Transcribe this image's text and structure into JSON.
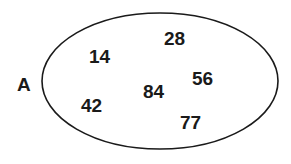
{
  "diagram": {
    "type": "set",
    "set_label": "A",
    "elements": [
      "28",
      "14",
      "56",
      "84",
      "42",
      "77"
    ],
    "stroke_color": "#1a1a1a",
    "text_color": "#1a1a1a"
  }
}
